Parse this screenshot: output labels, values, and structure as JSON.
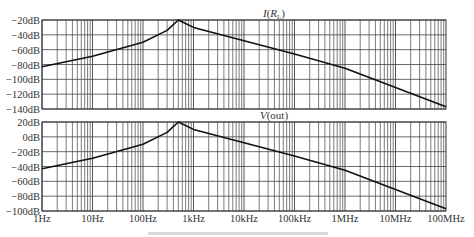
{
  "chart_data": [
    {
      "type": "line",
      "title": "I(R_L)",
      "title_main": "I(",
      "title_sub_var": "R",
      "title_sub": "L",
      "title_close": ")",
      "xscale": "log",
      "xlim": [
        1,
        100000000
      ],
      "ylim": [
        -140,
        -20
      ],
      "yticks": [
        -20,
        -40,
        -60,
        -80,
        -100,
        -120,
        -140
      ],
      "ytick_labels": [
        "−20dB",
        "−40dB",
        "−60dB",
        "−80dB",
        "−100dB",
        "−120dB",
        "−140dB"
      ],
      "grid": true,
      "series": [
        {
          "name": "I(RL)",
          "x": [
            1,
            10,
            100,
            300,
            500,
            1000,
            10000,
            100000,
            1000000,
            10000000,
            100000000
          ],
          "y": [
            -83,
            -69,
            -50,
            -34,
            -20,
            -30,
            -48,
            -66,
            -85,
            -111,
            -137
          ]
        }
      ]
    },
    {
      "type": "line",
      "title": "V(out)",
      "xscale": "log",
      "xlim": [
        1,
        100000000
      ],
      "ylim": [
        -100,
        20
      ],
      "yticks": [
        20,
        0,
        -20,
        -40,
        -60,
        -80,
        -100
      ],
      "ytick_labels": [
        "20dB",
        "0dB",
        "−20dB",
        "−40dB",
        "−60dB",
        "−80dB",
        "−100dB"
      ],
      "xticks": [
        1,
        10,
        100,
        1000,
        10000,
        100000,
        1000000,
        10000000,
        100000000
      ],
      "xtick_labels": [
        "1Hz",
        "10Hz",
        "100Hz",
        "1kHz",
        "10kHz",
        "100kHz",
        "1MHz",
        "10MHz",
        "100MHz"
      ],
      "grid": true,
      "series": [
        {
          "name": "V(out)",
          "x": [
            1,
            10,
            100,
            300,
            500,
            1000,
            10000,
            100000,
            1000000,
            10000000,
            100000000
          ],
          "y": [
            -43,
            -29,
            -10,
            6,
            20,
            10,
            -8,
            -26,
            -45,
            -71,
            -97
          ]
        }
      ]
    }
  ]
}
